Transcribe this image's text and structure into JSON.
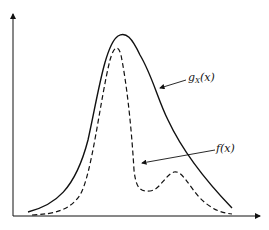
{
  "diagram": {
    "labels": {
      "g_main": "g",
      "g_sub": "X",
      "g_arg": "(x)",
      "f": "f(x)"
    },
    "curves": [
      {
        "name": "g_X(x)",
        "style": "solid"
      },
      {
        "name": "f(x)",
        "style": "dashed"
      }
    ],
    "colors": {
      "line": "#111111",
      "background": "#ffffff"
    }
  }
}
